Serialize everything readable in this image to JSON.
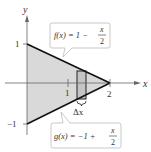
{
  "figure": {
    "axes": {
      "x_label": "x",
      "y_label": "y",
      "x_ticks": [
        "1",
        "2"
      ],
      "y_ticks": [
        "1",
        "−1"
      ]
    },
    "region_fill": "#d9d9d9",
    "curves": [
      {
        "name": "f",
        "label": "f(x) = 1 − x/2",
        "lhs": "f(x) = 1 −",
        "num": "x",
        "den": "2"
      },
      {
        "name": "g",
        "label": "g(x) = −1 + x/2",
        "lhs": "g(x) = −1 +",
        "num": "x",
        "den": "2"
      }
    ],
    "rectangle_label": "Δx"
  }
}
